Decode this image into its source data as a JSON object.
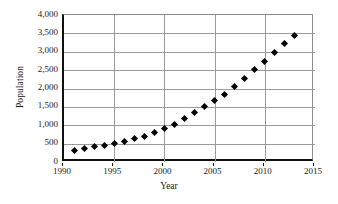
{
  "chart_data": {
    "type": "scatter",
    "title": "",
    "subtitle": "",
    "xlabel": "Year",
    "ylabel": "Population",
    "xlim": [
      1990,
      2015
    ],
    "ylim": [
      0,
      4000
    ],
    "grid": true,
    "legend": false,
    "legend_position": "none",
    "marker": "filled-diamond",
    "marker_color": "#000000",
    "x_ticks": [
      1990,
      1995,
      2000,
      2005,
      2010,
      2015
    ],
    "x_tick_labels": [
      "1990",
      "1995",
      "2000",
      "2005",
      "2010",
      "2015"
    ],
    "y_ticks": [
      0,
      500,
      1000,
      1500,
      2000,
      2500,
      3000,
      3500,
      4000
    ],
    "y_tick_labels": [
      "0",
      "500",
      "1,000",
      "1,500",
      "2,000",
      "2,500",
      "3,000",
      "3,500",
      "4,000"
    ],
    "x": [
      1991,
      1992,
      1993,
      1994,
      1995,
      1996,
      1997,
      1998,
      1999,
      2000,
      2001,
      2002,
      2003,
      2004,
      2005,
      2006,
      2007,
      2008,
      2009,
      2010,
      2011,
      2012,
      2013
    ],
    "values": [
      320,
      370,
      420,
      440,
      495,
      560,
      640,
      700,
      810,
      915,
      1030,
      1180,
      1350,
      1500,
      1660,
      1840,
      2060,
      2280,
      2510,
      2730,
      2980,
      3220,
      3450
    ],
    "categories": [
      "1991",
      "1992",
      "1993",
      "1994",
      "1995",
      "1996",
      "1997",
      "1998",
      "1999",
      "2000",
      "2001",
      "2002",
      "2003",
      "2004",
      "2005",
      "2006",
      "2007",
      "2008",
      "2009",
      "2010",
      "2011",
      "2012",
      "2013"
    ]
  }
}
